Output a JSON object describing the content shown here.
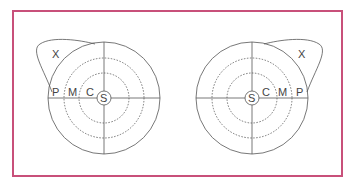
{
  "diagram": {
    "type": "fundus-zone-map",
    "left_eye": {
      "labels": {
        "center": "S",
        "central": "C",
        "mid": "M",
        "peripheral": "P",
        "extra": "X"
      }
    },
    "right_eye": {
      "labels": {
        "center": "S",
        "central": "C",
        "mid": "M",
        "peripheral": "P",
        "extra": "X"
      }
    },
    "colors": {
      "frame": "#c8507a",
      "line": "#555555"
    }
  }
}
